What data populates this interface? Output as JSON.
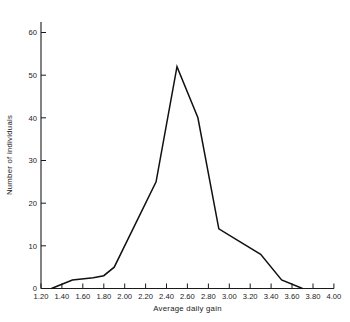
{
  "chart_data": {
    "type": "line",
    "title": "",
    "subtitle": "",
    "xlabel": "Average daily gain",
    "ylabel": "Number of individuals",
    "xlim": [
      1.2,
      4.0
    ],
    "ylim": [
      0,
      64
    ],
    "grid": false,
    "legend": null,
    "x_ticks": [
      1.2,
      1.4,
      1.6,
      1.8,
      2.0,
      2.2,
      2.4,
      2.6,
      2.8,
      3.0,
      3.2,
      3.4,
      3.6,
      3.8,
      4.0
    ],
    "x_tick_labels": [
      "1.20",
      "1.40",
      "1.60",
      "1.80",
      "2.00",
      "2.20",
      "2.40",
      "2.60",
      "2.80",
      "3.00",
      "3.20",
      "3.40",
      "3.60",
      "3.80",
      "4.00"
    ],
    "y_ticks": [
      0,
      10,
      20,
      30,
      40,
      50,
      60
    ],
    "y_tick_labels": [
      "0",
      "10",
      "20",
      "30",
      "40",
      "50",
      "60"
    ],
    "x": [
      1.3,
      1.4,
      1.5,
      1.7,
      1.8,
      1.9,
      2.3,
      2.5,
      2.7,
      2.9,
      3.1,
      3.3,
      3.5,
      3.7
    ],
    "values": [
      0,
      1,
      2,
      2.5,
      3,
      5,
      25,
      52,
      40,
      14,
      11,
      8,
      2,
      0
    ],
    "series": [
      {
        "name": "Frequency distribution",
        "color": "#111111",
        "points": [
          {
            "x": 1.3,
            "y": 0
          },
          {
            "x": 1.4,
            "y": 1
          },
          {
            "x": 1.5,
            "y": 2
          },
          {
            "x": 1.7,
            "y": 2.5
          },
          {
            "x": 1.8,
            "y": 3
          },
          {
            "x": 1.9,
            "y": 5
          },
          {
            "x": 2.3,
            "y": 25
          },
          {
            "x": 2.5,
            "y": 52
          },
          {
            "x": 2.7,
            "y": 40
          },
          {
            "x": 2.9,
            "y": 14
          },
          {
            "x": 3.1,
            "y": 11
          },
          {
            "x": 3.3,
            "y": 8
          },
          {
            "x": 3.5,
            "y": 2
          },
          {
            "x": 3.7,
            "y": 0
          }
        ]
      }
    ],
    "peak": {
      "x": 2.5,
      "y": 52
    },
    "colors": {
      "line": "#111111",
      "axis": "#1a1a1a",
      "text": "#1a1a1a",
      "background": "#ffffff"
    }
  }
}
